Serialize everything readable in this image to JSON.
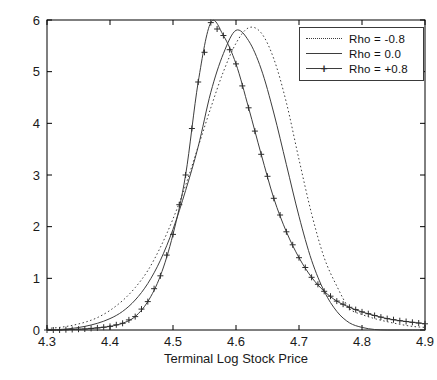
{
  "figure": {
    "xlabel": "Terminal Log Stock Price",
    "x_axis": {
      "min": 4.3,
      "max": 4.9,
      "ticks": [
        "4.3",
        "4.4",
        "4.5",
        "4.6",
        "4.7",
        "4.8",
        "4.9"
      ]
    },
    "y_axis": {
      "min": 0,
      "max": 6,
      "ticks": [
        "0",
        "1",
        "2",
        "3",
        "4",
        "5",
        "6"
      ]
    },
    "colors": {
      "line": "#3d3d3d",
      "marker": "#2e2e2e",
      "axis": "#000000",
      "text": "#1a1a1a",
      "background": "#ffffff"
    },
    "legend": {
      "items": [
        {
          "label": "Rho = -0.8",
          "style": "dotted"
        },
        {
          "label": "Rho = 0.0",
          "style": "solid"
        },
        {
          "label": "Rho = +0.8",
          "style": "plus"
        }
      ]
    }
  },
  "chart_data": {
    "type": "line",
    "title": "",
    "xlabel": "Terminal Log Stock Price",
    "ylabel": "",
    "xlim": [
      4.3,
      4.9
    ],
    "ylim": [
      0,
      6
    ],
    "grid": false,
    "legend_position": "top-right",
    "x": [
      4.3,
      4.32,
      4.34,
      4.36,
      4.38,
      4.4,
      4.42,
      4.44,
      4.46,
      4.48,
      4.5,
      4.52,
      4.54,
      4.56,
      4.58,
      4.6,
      4.62,
      4.64,
      4.66,
      4.68,
      4.7,
      4.72,
      4.74,
      4.76,
      4.78,
      4.8,
      4.82,
      4.84,
      4.86,
      4.88,
      4.9
    ],
    "series": [
      {
        "name": "Rho = -0.8",
        "style": "dotted",
        "values": [
          0.03,
          0.05,
          0.09,
          0.15,
          0.24,
          0.38,
          0.57,
          0.82,
          1.15,
          1.6,
          2.15,
          2.8,
          3.55,
          4.3,
          5.0,
          5.55,
          5.85,
          5.75,
          5.25,
          4.4,
          3.3,
          2.25,
          1.4,
          0.85,
          0.42,
          0.3,
          0.22,
          0.16,
          0.11,
          0.07,
          0.05
        ]
      },
      {
        "name": "Rho = 0.0",
        "style": "solid",
        "values": [
          0.0,
          0.01,
          0.03,
          0.07,
          0.13,
          0.22,
          0.36,
          0.58,
          0.9,
          1.35,
          1.95,
          2.7,
          3.55,
          4.6,
          5.35,
          5.8,
          5.6,
          5.05,
          4.2,
          3.2,
          2.2,
          1.35,
          0.75,
          0.36,
          0.14,
          0.05,
          0.01,
          0.0,
          0.0,
          0.0,
          0.0
        ]
      },
      {
        "name": "Rho = +0.8",
        "style": "plus-markers",
        "values": [
          0.0,
          0.0,
          0.01,
          0.02,
          0.04,
          0.07,
          0.13,
          0.26,
          0.55,
          1.05,
          1.85,
          3.0,
          4.8,
          5.95,
          5.7,
          5.15,
          4.3,
          3.4,
          2.55,
          1.9,
          1.4,
          1.02,
          0.75,
          0.56,
          0.44,
          0.35,
          0.28,
          0.22,
          0.18,
          0.15,
          0.12
        ]
      }
    ]
  }
}
